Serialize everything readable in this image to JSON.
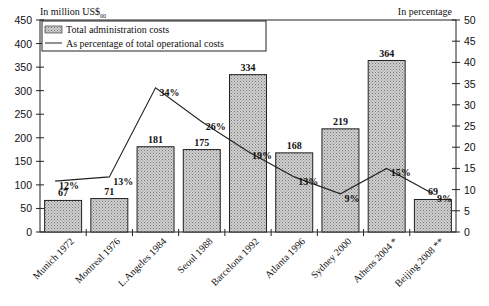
{
  "chart_data": {
    "type": "bar",
    "title": "",
    "left_axis_label": "In million US$2000",
    "right_axis_label": "In percentage",
    "categories": [
      "Munich 1972",
      "Montreal 1976",
      "L.Angeles 1984",
      "Seoul 1988",
      "Barcelona 1992",
      "Atlanta 1996",
      "Sydney 2000",
      "Athens 2004 *",
      "Beijing 2008 **"
    ],
    "series": [
      {
        "name": "Total administration costs",
        "type": "bar",
        "axis": "left",
        "values": [
          67,
          71,
          181,
          175,
          334,
          168,
          219,
          364,
          69
        ]
      },
      {
        "name": "As percentage of total operational costs",
        "type": "line",
        "axis": "right",
        "values": [
          12,
          13,
          34,
          26,
          19,
          13,
          9,
          15,
          9
        ],
        "labels": [
          "12%",
          "13%",
          "34%",
          "26%",
          "19%",
          "13%",
          "9%",
          "15%",
          "9%"
        ]
      }
    ],
    "ylim_left": [
      0,
      450
    ],
    "ylim_right": [
      0,
      50
    ],
    "yticks_left": [
      0,
      50,
      100,
      150,
      200,
      250,
      300,
      350,
      400,
      450
    ],
    "yticks_right": [
      0,
      5,
      10,
      15,
      20,
      25,
      30,
      35,
      40,
      45,
      50
    ],
    "grid": false,
    "legend_position": "top-left"
  },
  "legend": {
    "bar_label": "Total administration costs",
    "line_label": "As percentage of total operational costs"
  },
  "axes": {
    "left_title": "In million US$",
    "left_title_sub": "00",
    "right_title": "In percentage"
  }
}
